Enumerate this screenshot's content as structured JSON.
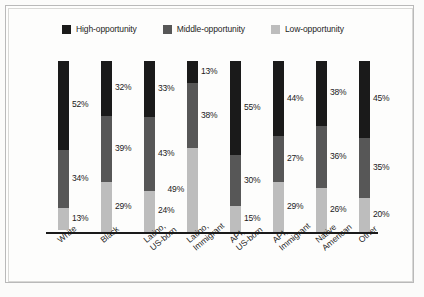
{
  "legend": {
    "items": [
      {
        "label": "High-opportunity",
        "color": "#1a1a1a",
        "key": "high"
      },
      {
        "label": "Middle-opportunity",
        "color": "#575757",
        "key": "middle"
      },
      {
        "label": "Low-opportunity",
        "color": "#bdbdbd",
        "key": "low"
      }
    ]
  },
  "chart_data": {
    "type": "bar",
    "stacked": true,
    "normalized": true,
    "title": "",
    "subtitle": "",
    "xlabel": "",
    "ylabel": "",
    "ylim": [
      0,
      100
    ],
    "grid": false,
    "legend_position": "top",
    "value_suffix": "%",
    "categories": [
      "White",
      "Latino,\nUS-born",
      "Latino,\nImmigrant",
      "API,\nUS-born",
      "API,\nImmigrant",
      "Native\nAmerican",
      "Other",
      "Black"
    ],
    "category_labels": [
      {
        "line1": "White",
        "line2": ""
      },
      {
        "line1": "Black",
        "line2": ""
      },
      {
        "line1": "Latino,",
        "line2": "US-born"
      },
      {
        "line1": "Latino,",
        "line2": "Immigrant"
      },
      {
        "line1": "API,",
        "line2": "US-born"
      },
      {
        "line1": "API,",
        "line2": "Immigrant"
      },
      {
        "line1": "Native",
        "line2": "American"
      },
      {
        "line1": "Other",
        "line2": ""
      }
    ],
    "series": [
      {
        "name": "High-opportunity",
        "color": "#1a1a1a",
        "values": [
          52,
          32,
          33,
          13,
          55,
          44,
          38,
          45
        ]
      },
      {
        "name": "Middle-opportunity",
        "color": "#575757",
        "values": [
          34,
          39,
          43,
          38,
          30,
          27,
          36,
          35
        ]
      },
      {
        "name": "Low-opportunity",
        "color": "#bdbdbd",
        "values": [
          13,
          29,
          24,
          49,
          15,
          29,
          26,
          20
        ]
      }
    ],
    "data_labels": [
      {
        "category": "White",
        "high": "52%",
        "middle": "34%",
        "low": "13%",
        "high_side": "right",
        "middle_side": "right",
        "low_side": "right"
      },
      {
        "category": "Black",
        "high": "32%",
        "middle": "39%",
        "low": "29%",
        "high_side": "right",
        "middle_side": "right",
        "low_side": "right"
      },
      {
        "category": "Latino, US-born",
        "high": "33%",
        "middle": "43%",
        "low": "24%",
        "high_side": "right",
        "middle_side": "right",
        "low_side": "right"
      },
      {
        "category": "Latino, Immigrant",
        "high": "13%",
        "middle": "38%",
        "low": "49%",
        "high_side": "right",
        "middle_side": "right",
        "low_side": "left"
      },
      {
        "category": "API, US-born",
        "high": "55%",
        "middle": "30%",
        "low": "15%",
        "high_side": "right",
        "middle_side": "right",
        "low_side": "right"
      },
      {
        "category": "API, Immigrant",
        "high": "44%",
        "middle": "27%",
        "low": "29%",
        "high_side": "right",
        "middle_side": "right",
        "low_side": "right"
      },
      {
        "category": "Native American",
        "high": "38%",
        "middle": "36%",
        "low": "26%",
        "high_side": "right",
        "middle_side": "right",
        "low_side": "right"
      },
      {
        "category": "Other",
        "high": "45%",
        "middle": "35%",
        "low": "20%",
        "high_side": "right",
        "middle_side": "right",
        "low_side": "right"
      }
    ]
  }
}
